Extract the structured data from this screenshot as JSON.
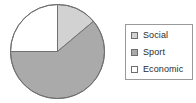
{
  "chart_data": {
    "type": "pie",
    "title": "",
    "labels": [
      "Social",
      "Sport",
      "Economic"
    ],
    "values": [
      13.9,
      61.1,
      25.0
    ],
    "start_angle_deg": 0,
    "direction": "clockwise",
    "slice_angles_deg": [
      50,
      220,
      90
    ],
    "colors": [
      "#d2d2d2",
      "#aaaaaa",
      "#ffffff"
    ],
    "edge_color": "#707070",
    "legend": {
      "position": "right",
      "border_color": "#9a9a9a",
      "background": "#ffffff",
      "entries": [
        {
          "label": "Social",
          "color": "#d2d2d2"
        },
        {
          "label": "Sport",
          "color": "#aaaaaa"
        },
        {
          "label": "Economic",
          "color": "#ffffff"
        }
      ]
    },
    "grid": false,
    "xlabel": "",
    "ylabel": ""
  }
}
